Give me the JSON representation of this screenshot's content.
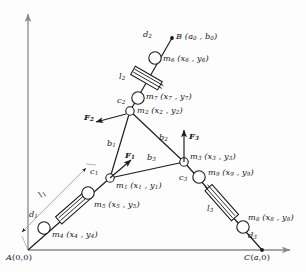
{
  "figure": {
    "type": "mechanism-kinematics-diagram",
    "stroke_color": "#1a1a1a",
    "axis_color": "#8a8a8a",
    "background": "#fdfdfd",
    "width": 306,
    "height": 272
  },
  "axes": {
    "origin_label": "A(0,0)",
    "right_label": "C(a,0)",
    "origin_x": 28,
    "origin_y": 250,
    "x_axis_end_x": 292,
    "y_axis_top_y": 10
  },
  "points": {
    "A": {
      "label": "A(0,0)",
      "x": 28,
      "y": 250
    },
    "B": {
      "label": "B (a",
      "label_sub": "0",
      "label_tail": ", b",
      "label_sub2": "0",
      "label_end": ")",
      "full": "B (a0 , b0)",
      "x": 172,
      "y": 38
    },
    "C": {
      "label": "C(a,0)",
      "x": 262,
      "y": 250
    }
  },
  "joints": [
    {
      "name": "m1",
      "label": "m1 (x1 , y1)",
      "x": 110,
      "y": 178,
      "r": 4.2
    },
    {
      "name": "m2",
      "label": "m2 (x2 , y2)",
      "x": 130,
      "y": 111,
      "r": 4.2
    },
    {
      "name": "m3",
      "label": "m3 (x3 , y3)",
      "x": 184,
      "y": 162,
      "r": 4.2
    },
    {
      "name": "m4",
      "label": "m4 (x4 , y4)",
      "x": 44,
      "y": 228,
      "r": 6.2
    },
    {
      "name": "m5",
      "label": "m5 (x5 , y5)",
      "x": 88,
      "y": 193,
      "r": 6.2
    },
    {
      "name": "m6",
      "label": "m6 (x6 , y6)",
      "x": 155,
      "y": 58,
      "r": 6.2
    },
    {
      "name": "m7",
      "label": "m7 (x7 , y7)",
      "x": 138,
      "y": 98,
      "r": 6.2
    },
    {
      "name": "m8",
      "label": "m8 (x8 , y8)",
      "x": 243,
      "y": 227,
      "r": 6.2
    },
    {
      "name": "m9",
      "label": "m9 (x9 , y9)",
      "x": 199,
      "y": 177,
      "r": 6.2
    }
  ],
  "labels": {
    "m1": {
      "base": "m",
      "sub": "1",
      "args": " (x",
      "sub2": "1",
      "args2": " , y",
      "sub3": "1",
      "close": ")"
    },
    "point_labels": [
      {
        "id": "d1",
        "text": "d",
        "sub": "1",
        "x": 33,
        "y": 214
      },
      {
        "id": "d2",
        "text": "d",
        "sub": "2",
        "x": 146,
        "y": 33
      },
      {
        "id": "d3",
        "text": "d",
        "sub": "3",
        "x": 250,
        "y": 235
      },
      {
        "id": "c1",
        "text": "c",
        "sub": "1",
        "x": 93,
        "y": 171
      },
      {
        "id": "c2",
        "text": "c",
        "sub": "2",
        "x": 121,
        "y": 100
      },
      {
        "id": "c3",
        "text": "c",
        "sub": "3",
        "x": 183,
        "y": 177
      },
      {
        "id": "l1",
        "text": "l",
        "sub": "1",
        "x": 42,
        "y": 193
      },
      {
        "id": "l2",
        "text": "l",
        "sub": "2",
        "x": 123,
        "y": 76
      },
      {
        "id": "l3",
        "text": "l",
        "sub": "3",
        "x": 211,
        "y": 208
      },
      {
        "id": "b1",
        "text": "b",
        "sub": "1",
        "x": 110,
        "y": 143
      },
      {
        "id": "b2",
        "text": "b",
        "sub": "2",
        "x": 162,
        "y": 137
      },
      {
        "id": "b3",
        "text": "b",
        "sub": "3",
        "x": 150,
        "y": 157
      }
    ],
    "forces": [
      {
        "id": "F1",
        "text": "F",
        "sub": "1",
        "x": 128,
        "y": 156
      },
      {
        "id": "F2",
        "text": "F",
        "sub": "2",
        "x": 90,
        "y": 117
      },
      {
        "id": "F3",
        "text": "F",
        "sub": "3",
        "x": 193,
        "y": 136
      }
    ],
    "mass_labels": [
      {
        "id": "m1",
        "text": "m",
        "sub": "1",
        "args": " (x",
        "sub2": "1",
        "args2": " , y",
        "sub3": "1",
        "close": ")",
        "x": 110,
        "y": 185
      },
      {
        "id": "m2",
        "text": "m",
        "sub": "2",
        "args": " (x",
        "sub2": "2",
        "args2": " , y",
        "sub3": "2",
        "close": ")",
        "x": 139,
        "y": 107
      },
      {
        "id": "m3",
        "text": "m",
        "sub": "3",
        "args": " (x",
        "sub2": "3",
        "args2": " , y",
        "sub3": "3",
        "close": ")",
        "x": 192,
        "y": 155
      },
      {
        "id": "m4",
        "text": "m",
        "sub": "4",
        "args": " (x",
        "sub2": "4",
        "args2": " , y",
        "sub3": "4",
        "close": ")",
        "x": 53,
        "y": 233
      },
      {
        "id": "m5",
        "text": "m",
        "sub": "5",
        "args": " (x",
        "sub2": "5",
        "args2": " , y",
        "sub3": "5",
        "close": ")",
        "x": 97,
        "y": 203
      },
      {
        "id": "m6",
        "text": "m",
        "sub": "6",
        "args": " (x",
        "sub2": "6",
        "args2": " , y",
        "sub3": "6",
        "close": ")",
        "x": 165,
        "y": 58
      },
      {
        "id": "m7",
        "text": "m",
        "sub": "7",
        "args": " (x",
        "sub2": "7",
        "args2": " , y",
        "sub3": "7",
        "close": ")",
        "x": 147,
        "y": 95
      },
      {
        "id": "m8",
        "text": "m",
        "sub": "8",
        "args": " (x",
        "sub2": "8",
        "args2": " , y",
        "sub3": "8",
        "close": ")",
        "x": 252,
        "y": 216
      },
      {
        "id": "m9",
        "text": "m",
        "sub": "9",
        "args": " (x",
        "sub2": "9",
        "args2": " , y",
        "sub3": "9",
        "close": ")",
        "x": 210,
        "y": 172
      }
    ]
  },
  "text": {
    "A_label": "A(0,0)",
    "C_label": "C(a,0)",
    "B_label": "B (a",
    "B_sub1": "0",
    "B_mid": " , b",
    "B_sub2": "0",
    "B_end": ")"
  },
  "links": [
    {
      "from": "A",
      "to": "m1",
      "name": "leg-1-prismatic"
    },
    {
      "from": "B",
      "to": "m2",
      "name": "leg-2-prismatic"
    },
    {
      "from": "C",
      "to": "m3",
      "name": "leg-3-prismatic"
    },
    {
      "from": "m1",
      "to": "m2",
      "name": "platform-edge-b1"
    },
    {
      "from": "m2",
      "to": "m3",
      "name": "platform-edge-b2"
    },
    {
      "from": "m1",
      "to": "m3",
      "name": "platform-edge-b3"
    }
  ]
}
